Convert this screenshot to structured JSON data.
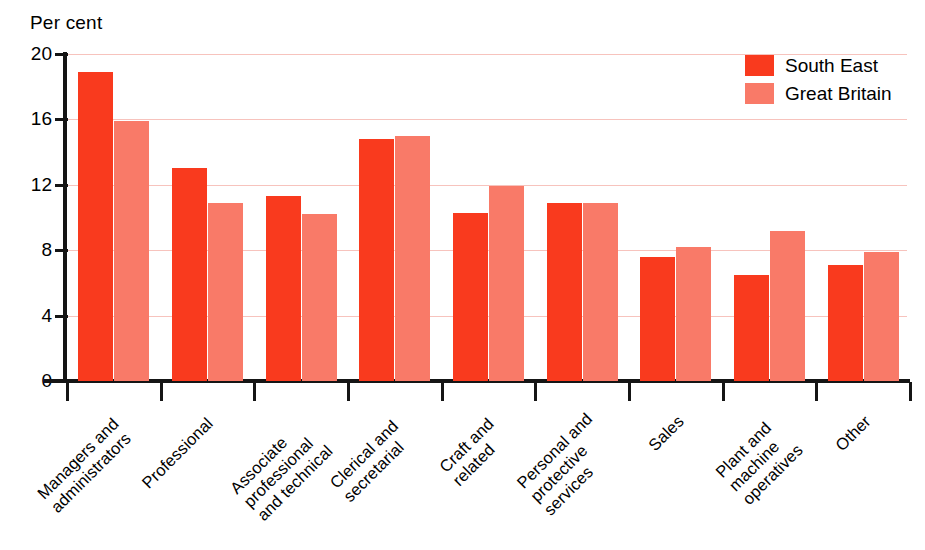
{
  "chart_data": {
    "type": "bar",
    "title": "",
    "ylabel": "Per cent",
    "xlabel": "",
    "ylim": [
      0,
      20
    ],
    "yticks": [
      0,
      4,
      8,
      12,
      16,
      20
    ],
    "grid": true,
    "legend_position": "top-right",
    "categories": [
      "Managers and\nadministrators",
      "Professional",
      "Associate\nprofessional\nand technical",
      "Clerical and\nsecretarial",
      "Craft and\nrelated",
      "Personal and\nprotective\nservices",
      "Sales",
      "Plant and\nmachine\noperatives",
      "Other"
    ],
    "series": [
      {
        "name": "South East",
        "color": "#f93a1e",
        "values": [
          18.9,
          13.0,
          11.3,
          14.8,
          10.3,
          10.9,
          7.6,
          6.5,
          7.1
        ]
      },
      {
        "name": "Great Britain",
        "color": "#f97a68",
        "values": [
          15.9,
          10.9,
          10.2,
          15.0,
          11.9,
          10.9,
          8.2,
          9.2,
          7.9
        ]
      }
    ]
  },
  "axis": {
    "y_title": "Per cent",
    "tick_labels": [
      "20",
      "16",
      "12",
      "8",
      "4",
      "0"
    ]
  },
  "legend": {
    "items": [
      {
        "label": "South East",
        "color": "#f93a1e"
      },
      {
        "label": "Great Britain",
        "color": "#f97a68"
      }
    ]
  },
  "colors": {
    "south_east": "#f93a1e",
    "great_britain": "#f97a68",
    "gridline": "#f7c3bd",
    "axis": "#151515",
    "background": "#ffffff"
  }
}
